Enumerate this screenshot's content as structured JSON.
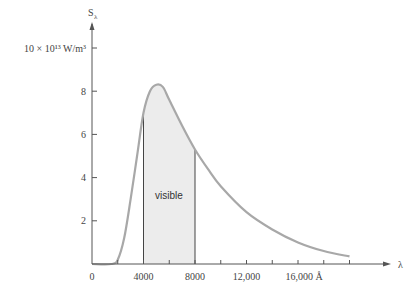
{
  "chart_data": {
    "type": "line",
    "title": "",
    "xlabel": "λ",
    "ylabel": "Sλ",
    "y_top_label": "10 × 10¹³ W/m³",
    "x_unit": "Å",
    "xlim": [
      0,
      20000
    ],
    "ylim": [
      0,
      10
    ],
    "x_ticks": [
      0,
      2000,
      4000,
      6000,
      8000,
      10000,
      12000,
      14000,
      16000,
      18000,
      20000
    ],
    "x_tick_labels": [
      {
        "value": 0,
        "label": "0"
      },
      {
        "value": 4000,
        "label": "4000"
      },
      {
        "value": 8000,
        "label": "8000"
      },
      {
        "value": 12000,
        "label": "12,000"
      },
      {
        "value": 16000,
        "label": "16,000 Å"
      }
    ],
    "y_tick_labels": [
      {
        "value": 2,
        "label": "2"
      },
      {
        "value": 4,
        "label": "4"
      },
      {
        "value": 6,
        "label": "6"
      },
      {
        "value": 8,
        "label": "8"
      },
      {
        "value": 10,
        "label": "10 × 10¹³ W/m³"
      }
    ],
    "grid": false,
    "legend": null,
    "series": [
      {
        "name": "Solar spectral irradiance",
        "x": [
          0,
          1500,
          2000,
          2500,
          3000,
          3500,
          4000,
          4500,
          5000,
          5500,
          6000,
          7000,
          8000,
          9000,
          10000,
          12000,
          14000,
          16000,
          18000,
          20000
        ],
        "values": [
          0,
          0,
          0.2,
          1.2,
          3.0,
          5.0,
          7.0,
          8.0,
          8.3,
          8.2,
          7.6,
          6.4,
          5.3,
          4.4,
          3.6,
          2.4,
          1.6,
          1.0,
          0.6,
          0.35
        ]
      }
    ],
    "annotations": [
      {
        "type": "shaded_region",
        "x_from": 4000,
        "x_to": 8000,
        "label": "visible"
      }
    ]
  },
  "labels": {
    "y_axis": "S",
    "y_axis_sub": "λ",
    "x_axis": "λ",
    "y_top": "10 × 10¹³ W/m³",
    "region": "visible"
  },
  "colors": {
    "curve": "#a8a8a8",
    "shade": "#ececec",
    "axis": "#555555",
    "text": "#444444"
  }
}
